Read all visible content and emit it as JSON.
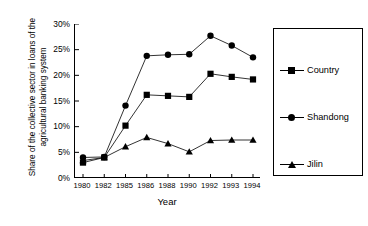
{
  "chart_data": {
    "type": "line",
    "title": "",
    "xlabel": "Year",
    "ylabel": "Share of the collective sector in loans of the agricultural banking system",
    "categories": [
      "1980",
      "1982",
      "1985",
      "1986",
      "1988",
      "1990",
      "1992",
      "1993",
      "1994"
    ],
    "ylim": [
      0,
      30
    ],
    "yticks": [
      "0%",
      "5%",
      "10%",
      "15%",
      "20%",
      "25%",
      "30%"
    ],
    "ytick_values": [
      0,
      5,
      10,
      15,
      20,
      25,
      30
    ],
    "grid": false,
    "legend_position": "right",
    "series": [
      {
        "name": "Country",
        "marker": "square",
        "color": "#000000",
        "values": [
          3.0,
          4.0,
          10.2,
          16.2,
          16.0,
          15.8,
          20.3,
          19.7,
          19.2
        ]
      },
      {
        "name": "Shandong",
        "marker": "circle",
        "color": "#000000",
        "values": [
          4.0,
          4.1,
          14.1,
          23.8,
          24.0,
          24.1,
          27.7,
          25.8,
          23.5
        ]
      },
      {
        "name": "Jilin",
        "marker": "triangle",
        "color": "#000000",
        "values": [
          3.4,
          4.0,
          6.1,
          7.9,
          6.7,
          5.1,
          7.3,
          7.4,
          7.4
        ]
      }
    ]
  },
  "legend": {
    "entries": [
      {
        "label": "Country"
      },
      {
        "label": "Shandong"
      },
      {
        "label": "Jilin"
      }
    ]
  }
}
